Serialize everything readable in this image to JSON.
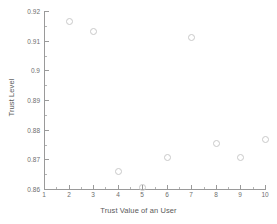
{
  "chart_data": {
    "type": "scatter",
    "title": "",
    "xlabel": "Trust Value of an User",
    "ylabel": "Trust Level",
    "x": [
      2,
      3,
      4,
      5,
      6,
      7,
      8,
      9,
      10
    ],
    "values": [
      0.9166,
      0.9132,
      0.8661,
      0.8607,
      0.8708,
      0.9112,
      0.8755,
      0.8708,
      0.8769
    ],
    "series": [
      {
        "name": "Trust Level",
        "points": [
          {
            "x": 2,
            "y": 0.9166
          },
          {
            "x": 3,
            "y": 0.9132
          },
          {
            "x": 4,
            "y": 0.8661
          },
          {
            "x": 5,
            "y": 0.8607
          },
          {
            "x": 6,
            "y": 0.8708
          },
          {
            "x": 7,
            "y": 0.9112
          },
          {
            "x": 8,
            "y": 0.8755
          },
          {
            "x": 9,
            "y": 0.8708
          },
          {
            "x": 10,
            "y": 0.8769
          }
        ]
      }
    ],
    "xlim": [
      1,
      10
    ],
    "ylim": [
      0.86,
      0.92
    ],
    "xticks": [
      1,
      2,
      3,
      4,
      5,
      6,
      7,
      8,
      9,
      10
    ],
    "xticklabels": [
      "1",
      "2",
      "3",
      "4",
      "5",
      "6",
      "7",
      "8",
      "9",
      "10"
    ],
    "yticks": [
      0.86,
      0.87,
      0.88,
      0.89,
      0.9,
      0.91,
      0.92
    ],
    "yticklabels": [
      "0.86",
      "0.87",
      "0.88",
      "0.89",
      "0.9",
      "0.91",
      "0.92"
    ],
    "grid": false,
    "legend": null,
    "marker": "open-circle",
    "marker_color": "#c9c9c9",
    "axis_color": "#9a9a9a",
    "background": "#ffffff"
  }
}
